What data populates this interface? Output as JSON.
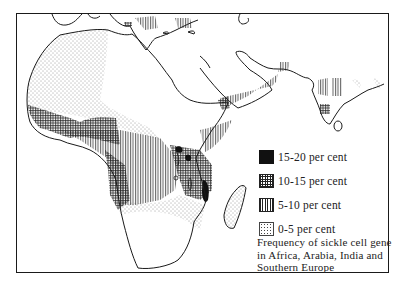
{
  "map": {
    "title": "Frequency of sickle cell gene in Africa, Arabia, India and Southern Europe",
    "caption_lines": [
      "Frequency of sickle cell gene",
      "in Africa, Arabia, India and",
      "Southern Europe"
    ],
    "regions_shown": [
      "Africa",
      "Arabia",
      "India",
      "Southern Europe",
      "Madagascar",
      "Sri Lanka"
    ]
  },
  "legend": {
    "items": [
      {
        "label": "15-20 per cent",
        "pattern": "solid-black"
      },
      {
        "label": "10-15 per cent",
        "pattern": "crosshatch"
      },
      {
        "label": "5-10 per cent",
        "pattern": "vertical-lines"
      },
      {
        "label": "0-5 per cent",
        "pattern": "stipple"
      }
    ]
  },
  "colors": {
    "ink": "#1a1a1a",
    "paper": "#ffffff"
  }
}
